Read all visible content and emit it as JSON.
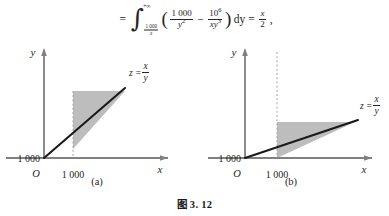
{
  "formula": {
    "leading_equals": "=",
    "integral_upper": "+∞",
    "integral_lower_num": "1 000",
    "integral_lower_den": "x",
    "open_paren": "(",
    "term1_num": "1 000",
    "term1_den": "y",
    "term1_den_exp": "2",
    "minus": "−",
    "term2_num": "10",
    "term2_num_exp": "6",
    "term2_den": "xy",
    "term2_den_exp": "3",
    "close_paren": ")",
    "differential": "dy",
    "equals": "=",
    "result_num": "x",
    "result_den": "2",
    "trailing_comma": ","
  },
  "charts": [
    {
      "id": "a",
      "panel_label": "(a)",
      "y_axis_label": "y",
      "x_axis_label": "x",
      "origin_label": "O",
      "x_tick_label": "1 000",
      "y_tick_label": "1 000",
      "curve_label_lhs": "z =",
      "curve_label_num": "x",
      "curve_label_den": "y",
      "line_slope_description": "steep",
      "shade_color": "#bdbdbd"
    },
    {
      "id": "b",
      "panel_label": "(b)",
      "y_axis_label": "y",
      "x_axis_label": "x",
      "origin_label": "O",
      "x_tick_label": "1 000",
      "y_tick_label": "1 000",
      "curve_label_lhs": "z =",
      "curve_label_num": "x",
      "curve_label_den": "y",
      "line_slope_description": "shallow",
      "shade_color": "#bdbdbd"
    }
  ],
  "caption": "图 3. 12",
  "colors": {
    "axis": "#808080",
    "curve": "#1a1a1a",
    "dashed": "#9a9a9a",
    "shade": "#bdbdbd",
    "text": "#262626",
    "background": "#ffffff"
  }
}
